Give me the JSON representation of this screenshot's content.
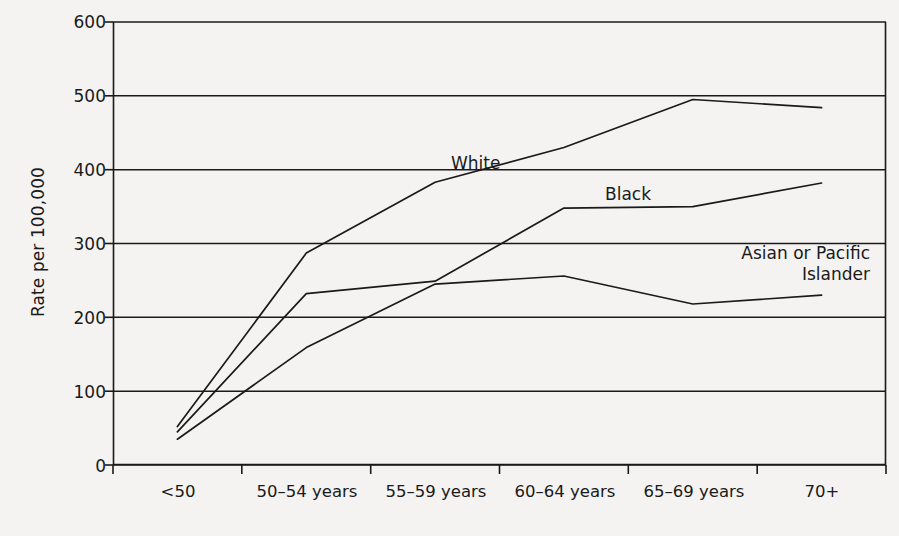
{
  "chart_data": {
    "type": "line",
    "title": "",
    "xlabel": "",
    "ylabel": "Rate per 100,000",
    "categories": [
      "<50",
      "50–54 years",
      "55–59 years",
      "60–64 years",
      "65–69 years",
      "70+"
    ],
    "ylim": [
      0,
      600
    ],
    "yticks": [
      0,
      100,
      200,
      300,
      400,
      500,
      600
    ],
    "ytick_labels": [
      "0",
      "100",
      "200",
      "300",
      "400",
      "500",
      "600"
    ],
    "grid": "horizontal",
    "legend_position": "inline-annotations",
    "series": [
      {
        "name": "White",
        "label": "White",
        "values": [
          52,
          287,
          383,
          430,
          495,
          484
        ],
        "color": "#1a1a1a"
      },
      {
        "name": "Black",
        "label": "Black",
        "values": [
          45,
          232,
          249,
          348,
          350,
          382
        ],
        "color": "#1a1a1a"
      },
      {
        "name": "Asian or Pacific Islander",
        "label": "Asian or Pacific\nIslander",
        "values": [
          35,
          159,
          245,
          256,
          218,
          230
        ],
        "color": "#1a1a1a"
      }
    ],
    "annotations": [
      {
        "text": "White",
        "series": "White"
      },
      {
        "text": "Black",
        "series": "Black"
      },
      {
        "text": "Asian or Pacific\nIslander",
        "series": "Asian or Pacific Islander"
      }
    ]
  },
  "figure": {
    "background_color": "#f4f3f1",
    "line_color": "#1a1a1a",
    "axis_color": "#1a1a1a"
  }
}
